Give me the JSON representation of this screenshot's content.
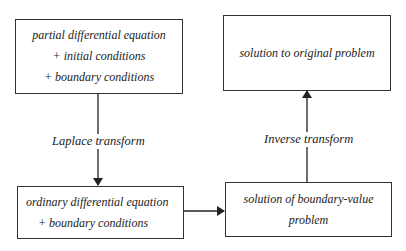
{
  "boxes": {
    "pde": {
      "lines": [
        "partial differential equation",
        "+ initial conditions",
        "+ boundary conditions"
      ]
    },
    "solution_original": {
      "lines": [
        "solution to original problem"
      ]
    },
    "ode": {
      "lines": [
        "ordinary differential equation",
        "+ boundary conditions"
      ]
    },
    "solution_bvp": {
      "lines": [
        "solution of boundary-value",
        "problem"
      ]
    }
  },
  "edges": {
    "laplace": {
      "label": "Laplace transform"
    },
    "inverse": {
      "label": "Inverse transform"
    }
  }
}
